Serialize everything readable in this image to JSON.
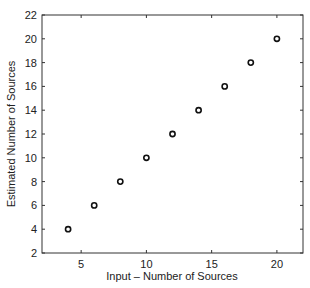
{
  "chart_data": {
    "type": "scatter",
    "title": "",
    "xlabel": "Input – Number of Sources",
    "ylabel": "Estimated Number of Sources",
    "xlim": [
      2,
      22
    ],
    "ylim": [
      2,
      22
    ],
    "x_ticks": [
      5,
      10,
      15,
      20
    ],
    "y_ticks": [
      2,
      4,
      6,
      8,
      10,
      12,
      14,
      16,
      18,
      20,
      22
    ],
    "grid": false,
    "legend": null,
    "marker": "open-circle",
    "series": [
      {
        "name": "estimates",
        "x": [
          4,
          6,
          8,
          10,
          12,
          14,
          16,
          18,
          20
        ],
        "y": [
          4,
          6,
          8,
          10,
          12,
          14,
          16,
          18,
          20
        ]
      }
    ]
  },
  "colors": {
    "axis": "#333333",
    "marker": "#111111",
    "background": "#ffffff"
  }
}
